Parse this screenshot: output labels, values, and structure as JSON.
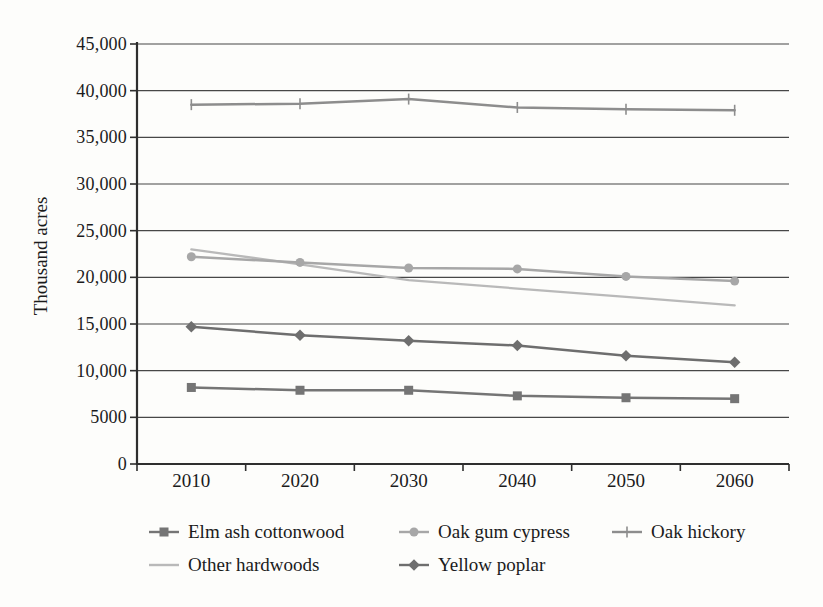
{
  "colors": {
    "background": "#fdfdfb",
    "text": "#1b1b1b",
    "grid": "#474747",
    "axis": "#2e2e2e"
  },
  "chart_data": {
    "type": "line",
    "title": "",
    "xlabel": "",
    "ylabel": "Thousand acres",
    "categories": [
      "2010",
      "2020",
      "2030",
      "2040",
      "2050",
      "2060"
    ],
    "ylim": [
      0,
      45000
    ],
    "y_tick_step": 5000,
    "y_tick_labels": [
      "0",
      "5000",
      "10,000",
      "15,000",
      "20,000",
      "25,000",
      "30,000",
      "35,000",
      "40,000",
      "45,000"
    ],
    "grid": true,
    "legend_position": "bottom",
    "series": [
      {
        "name": "Elm ash cottonwood",
        "marker": "square",
        "color": "#757575",
        "values": [
          8200,
          7900,
          7900,
          7300,
          7100,
          7000
        ]
      },
      {
        "name": "Oak gum cypress",
        "marker": "circle",
        "color": "#a7a7a7",
        "values": [
          22200,
          21600,
          21000,
          20900,
          20100,
          19600
        ]
      },
      {
        "name": "Oak hickory",
        "marker": "plus",
        "color": "#8d8d8d",
        "values": [
          38500,
          38600,
          39100,
          38200,
          38000,
          37900
        ]
      },
      {
        "name": "Other hardwoods",
        "marker": "none",
        "color": "#b9b9b9",
        "values": [
          23000,
          21400,
          19700,
          18800,
          17900,
          17000
        ]
      },
      {
        "name": "Yellow poplar",
        "marker": "diamond",
        "color": "#6e6e6e",
        "values": [
          14700,
          13800,
          13200,
          12700,
          11600,
          10900
        ]
      }
    ],
    "legend_rows": [
      [
        "Elm ash cottonwood",
        "Oak gum cypress",
        "Oak hickory"
      ],
      [
        "Other hardwoods",
        "Yellow poplar"
      ]
    ]
  }
}
